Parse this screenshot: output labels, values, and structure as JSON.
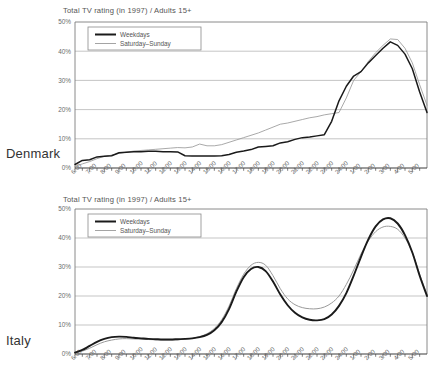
{
  "colors": {
    "weekdays": "#1a1a1a",
    "weekend": "#9a9a9a",
    "grid": "#b6b6b6",
    "axis": "#7d7d7d",
    "text": "#5a5a5a",
    "background": "#ffffff"
  },
  "panels": [
    {
      "country": "Denmark",
      "chart_data": {
        "type": "line",
        "title": "Total TV rating (in 1997) / Adults 15+",
        "xlabel": "",
        "ylabel": "",
        "ylim": [
          0,
          50
        ],
        "yticks": [
          0,
          10,
          20,
          30,
          40,
          50
        ],
        "ytick_labels": [
          "0%",
          "10%",
          "20%",
          "30%",
          "40%",
          "50%"
        ],
        "grid": true,
        "legend_position": "top-left",
        "x_start_hour": 6,
        "x_end_hour": 29,
        "xtick_labels": [
          "6:00",
          "7:00",
          "8:00",
          "9:00",
          "10:00",
          "11:00",
          "12:00",
          "13:00",
          "14:00",
          "15:00",
          "16:00",
          "17:00",
          "18:00",
          "19:00",
          "20:00",
          "21:00",
          "22:00",
          "23:00",
          "24:00",
          "1:00",
          "2:00",
          "3:00",
          "4:00",
          "5:00"
        ],
        "minor_ticks_per_hour": 2,
        "x": [
          6,
          6.5,
          7,
          7.5,
          8,
          8.5,
          9,
          9.5,
          10,
          10.5,
          11,
          11.5,
          12,
          12.5,
          13,
          13.5,
          14,
          14.5,
          15,
          15.5,
          16,
          16.5,
          17,
          17.5,
          18,
          18.5,
          19,
          19.5,
          20,
          20.5,
          21,
          21.5,
          22,
          22.5,
          23,
          23.5,
          24,
          24.5,
          25,
          25.5,
          26,
          26.5,
          27,
          27.5,
          28,
          28.5,
          29
        ],
        "series": [
          {
            "name": "Weekdays",
            "style": "thick-dark",
            "values": [
              1.2,
              2.6,
              2.8,
              3.8,
              4.0,
              4.2,
              5.2,
              5.4,
              5.6,
              5.6,
              5.7,
              5.7,
              5.6,
              5.6,
              5.5,
              4.2,
              4.1,
              4.1,
              4.1,
              4.1,
              4.2,
              4.6,
              5.4,
              5.8,
              6.3,
              7.2,
              7.4,
              7.6,
              8.6,
              9.0,
              9.8,
              10.4,
              10.6,
              11.0,
              11.4,
              16.0,
              23.0,
              28.0,
              31.5,
              33.0,
              36.0,
              38.5,
              41.0,
              43.2,
              42.0,
              39.0,
              34.0
            ]
          },
          {
            "name": "Saturday–Sunday",
            "style": "thin-gray",
            "values": [
              0.6,
              1.4,
              2.2,
              3.2,
              4.0,
              4.4,
              5.0,
              5.4,
              5.8,
              6.0,
              6.2,
              6.4,
              6.6,
              6.8,
              7.0,
              6.9,
              7.2,
              8.2,
              7.6,
              7.6,
              8.0,
              8.8,
              9.6,
              10.4,
              11.2,
              12.0,
              13.0,
              14.0,
              15.0,
              15.4,
              16.0,
              16.6,
              17.2,
              17.6,
              18.2,
              18.6,
              19.0,
              24.0,
              30.0,
              33.0,
              36.5,
              39.5,
              42.0,
              44.2,
              44.0,
              41.0,
              36.0
            ]
          }
        ],
        "series_tail": {
          "x": [
            29,
            29.5,
            30,
            30.5,
            31,
            31.5,
            32,
            32.5,
            33,
            33.5,
            34,
            34.5,
            35,
            35.5,
            36,
            36.5,
            37,
            37.5,
            38,
            38.5,
            39,
            39.5,
            40
          ],
          "weekdays": [
            34.0,
            26.0,
            19.0,
            14.0,
            10.0,
            7.2,
            5.0,
            3.6,
            2.6,
            2.0,
            1.6,
            1.3,
            1.1,
            1.0,
            0.9,
            0.8,
            0.7,
            0.6,
            0.5,
            0.45,
            0.4,
            0.35,
            0.3
          ],
          "weekend": [
            36.0,
            28.5,
            21.5,
            16.0,
            12.0,
            9.0,
            6.5,
            4.8,
            3.6,
            2.8,
            2.2,
            1.8,
            1.5,
            1.3,
            1.1,
            1.0,
            0.9,
            0.8,
            0.7,
            0.6,
            0.5,
            0.45,
            0.4
          ]
        },
        "peaks": {
          "weekdays": {
            "hour": "21:30",
            "value": 43
          },
          "weekend": {
            "hour": "21:30",
            "value": 44
          }
        }
      }
    },
    {
      "country": "Italy",
      "chart_data": {
        "type": "line",
        "title": "Total TV rating (in 1997) / Adults 15+",
        "xlabel": "",
        "ylabel": "",
        "ylim": [
          0,
          50
        ],
        "yticks": [
          0,
          10,
          20,
          30,
          40,
          50
        ],
        "ytick_labels": [
          "0%",
          "10%",
          "20%",
          "30%",
          "40%",
          "50%"
        ],
        "grid": true,
        "legend_position": "top-left",
        "x_start_hour": 6,
        "x_end_hour": 29,
        "xtick_labels": [
          "6:00",
          "7:00",
          "8:00",
          "9:00",
          "10:00",
          "11:00",
          "12:00",
          "13:00",
          "14:00",
          "15:00",
          "16:00",
          "17:00",
          "18:00",
          "19:00",
          "20:00",
          "21:00",
          "22:00",
          "23:00",
          "24:00",
          "1:00",
          "2:00",
          "3:00",
          "4:00",
          "5:00"
        ],
        "minor_ticks_per_hour": 2,
        "x": [
          6,
          6.5,
          7,
          7.5,
          8,
          8.5,
          9,
          9.5,
          10,
          10.5,
          11,
          11.5,
          12,
          12.5,
          13,
          13.5,
          14,
          14.5,
          15,
          15.5,
          16,
          16.5,
          17,
          17.5,
          18,
          18.5,
          19,
          19.5,
          20,
          20.5,
          21,
          21.5,
          22,
          22.5,
          23,
          23.5,
          24,
          24.5,
          25,
          25.5,
          26,
          26.5,
          27,
          27.5,
          28,
          28.5,
          29
        ],
        "series": [
          {
            "name": "Weekdays",
            "style": "thick-dark",
            "values": [
              0.5,
              1.4,
              2.8,
              4.2,
              5.2,
              5.8,
              6.0,
              5.9,
              5.6,
              5.4,
              5.2,
              5.1,
              5.0,
              5.0,
              5.1,
              5.2,
              5.4,
              5.8,
              6.6,
              8.2,
              11.0,
              15.5,
              21.5,
              26.5,
              29.3,
              30.0,
              28.6,
              25.0,
              20.5,
              16.8,
              14.2,
              12.6,
              11.8,
              11.6,
              12.0,
              13.6,
              16.6,
              21.0,
              27.0,
              33.5,
              39.5,
              44.0,
              46.4,
              46.8,
              45.0,
              41.0,
              35.0
            ]
          },
          {
            "name": "Saturday–Sunday",
            "style": "thin-gray",
            "values": [
              0.4,
              1.0,
              2.0,
              3.2,
              4.2,
              4.8,
              5.2,
              5.3,
              5.2,
              5.1,
              5.0,
              4.9,
              4.8,
              4.8,
              4.9,
              5.1,
              5.4,
              6.0,
              7.0,
              8.8,
              11.8,
              16.5,
              22.5,
              27.5,
              30.6,
              31.6,
              30.6,
              27.0,
              22.5,
              19.0,
              17.0,
              16.0,
              15.6,
              15.6,
              16.2,
              17.6,
              20.0,
              24.0,
              29.0,
              34.5,
              39.0,
              42.2,
              43.8,
              44.0,
              43.0,
              40.0,
              35.0
            ]
          }
        ],
        "series_tail": {
          "x": [
            29,
            29.5,
            30,
            30.5,
            31,
            31.5,
            32,
            32.5,
            33,
            33.5,
            34,
            34.5,
            35,
            35.5,
            36,
            36.5,
            37,
            37.5,
            38,
            38.5,
            39,
            39.5,
            40
          ],
          "weekdays": [
            35.0,
            27.0,
            20.0,
            14.5,
            10.2,
            7.0,
            4.8,
            3.2,
            2.2,
            1.6,
            1.2,
            1.0,
            0.8,
            0.7,
            0.6,
            0.5,
            0.45,
            0.4,
            0.35,
            0.3,
            0.3,
            0.25,
            0.25
          ],
          "weekend": [
            35.0,
            27.5,
            20.5,
            15.0,
            10.6,
            7.4,
            5.0,
            3.4,
            2.4,
            1.8,
            1.4,
            1.1,
            0.9,
            0.8,
            0.7,
            0.6,
            0.5,
            0.45,
            0.4,
            0.35,
            0.3,
            0.3,
            0.25
          ]
        },
        "peaks": {
          "weekdays": {
            "hour": "21:30",
            "value": 47
          },
          "weekend": {
            "hour": "21:30",
            "value": 44
          },
          "weekdays_lunch": {
            "hour": "18:30",
            "value": 30
          },
          "weekend_lunch": {
            "hour": "18:30",
            "value": 31.6
          }
        }
      }
    }
  ],
  "legend": {
    "weekdays_label": "Weekdays",
    "weekend_label": "Saturday–Sunday"
  }
}
